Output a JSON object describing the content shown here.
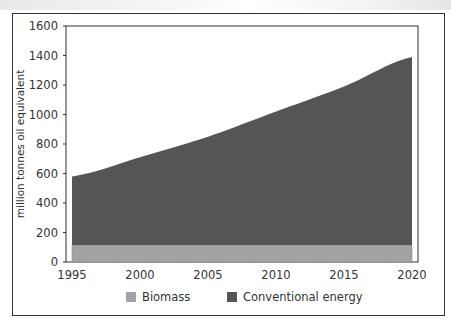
{
  "chart_data": {
    "type": "area",
    "stacked": true,
    "title": "",
    "xlabel": "",
    "ylabel": "million tonnes oil equivalent",
    "x": [
      1995,
      2000,
      2005,
      2010,
      2015,
      2020
    ],
    "x_tick_labels": [
      "1995",
      "2000",
      "2005",
      "2010",
      "2015",
      "2020"
    ],
    "y_tick_labels": [
      "0",
      "200",
      "400",
      "600",
      "800",
      "1000",
      "1200",
      "1400",
      "1600"
    ],
    "ylim": [
      0,
      1600
    ],
    "xlim": [
      1995,
      2020
    ],
    "grid": false,
    "legend_position": "bottom",
    "series": [
      {
        "name": "Biomass",
        "color": "#a3a3a3",
        "values": [
          115,
          115,
          115,
          115,
          115,
          115
        ]
      },
      {
        "name": "Conventional energy",
        "color": "#555555",
        "values": [
          465,
          595,
          735,
          905,
          1075,
          1275
        ],
        "cumulative_top": [
          580,
          710,
          850,
          1020,
          1190,
          1390
        ]
      }
    ]
  },
  "legend": {
    "items": [
      {
        "label": "Biomass",
        "color": "#a3a3a3"
      },
      {
        "label": "Conventional energy",
        "color": "#555555"
      }
    ]
  },
  "axes": {
    "ylabel": "million tonnes oil equivalent",
    "y_ticks": [
      "0",
      "200",
      "400",
      "600",
      "800",
      "1000",
      "1200",
      "1400",
      "1600"
    ],
    "x_ticks": [
      "1995",
      "2000",
      "2005",
      "2010",
      "2015",
      "2020"
    ]
  }
}
